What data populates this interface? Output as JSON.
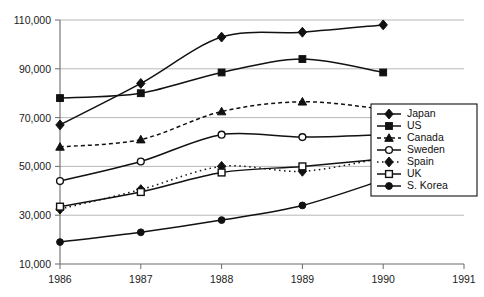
{
  "chart_data": {
    "type": "line",
    "title": "",
    "subtitle": "",
    "xlabel": "",
    "ylabel": "",
    "grid": true,
    "legend_position": "right-inside",
    "x": [
      1986,
      1987,
      1988,
      1989,
      1990
    ],
    "x_tick_labels": [
      "1986",
      "1987",
      "1988",
      "1989",
      "1990",
      "1991"
    ],
    "x_ticks": [
      1986,
      1987,
      1988,
      1989,
      1990,
      1991
    ],
    "xlim": [
      1986,
      1991
    ],
    "ylim": [
      10000,
      110000
    ],
    "y_ticks": [
      10000,
      30000,
      50000,
      70000,
      90000,
      110000
    ],
    "y_tick_labels": [
      "10,000",
      "30,000",
      "50,000",
      "70,000",
      "90,000",
      "110,000"
    ],
    "series": [
      {
        "name": "Japan",
        "marker": "filled-diamond",
        "line": "solid",
        "values": [
          67000,
          84000,
          103000,
          105000,
          108000
        ]
      },
      {
        "name": "US",
        "marker": "filled-square",
        "line": "solid",
        "values": [
          78000,
          80000,
          88500,
          94000,
          88500
        ]
      },
      {
        "name": "Canada",
        "marker": "filled-triangle",
        "line": "dashed",
        "values": [
          58000,
          61000,
          72500,
          76500,
          73500
        ]
      },
      {
        "name": "Sweden",
        "marker": "open-circle",
        "line": "solid",
        "values": [
          44000,
          52000,
          63000,
          62000,
          63000
        ]
      },
      {
        "name": "Spain",
        "marker": "filled-diamond",
        "line": "dotted",
        "values": [
          32500,
          40500,
          50000,
          48000,
          53500
        ]
      },
      {
        "name": "UK",
        "marker": "open-square",
        "line": "solid",
        "values": [
          33500,
          39500,
          47500,
          50000,
          53000
        ]
      },
      {
        "name": "S. Korea",
        "marker": "filled-circle",
        "line": "solid",
        "values": [
          19000,
          23000,
          28000,
          34000,
          44500
        ]
      }
    ]
  },
  "legend": {
    "entries": [
      {
        "label": "Japan"
      },
      {
        "label": "US"
      },
      {
        "label": "Canada"
      },
      {
        "label": "Sweden"
      },
      {
        "label": "Spain"
      },
      {
        "label": "UK"
      },
      {
        "label": "S. Korea"
      }
    ]
  },
  "colors": {
    "ink": "#111111",
    "grid": "#9a9a9a",
    "axis": "#6b6b6b",
    "background": "#ffffff"
  }
}
